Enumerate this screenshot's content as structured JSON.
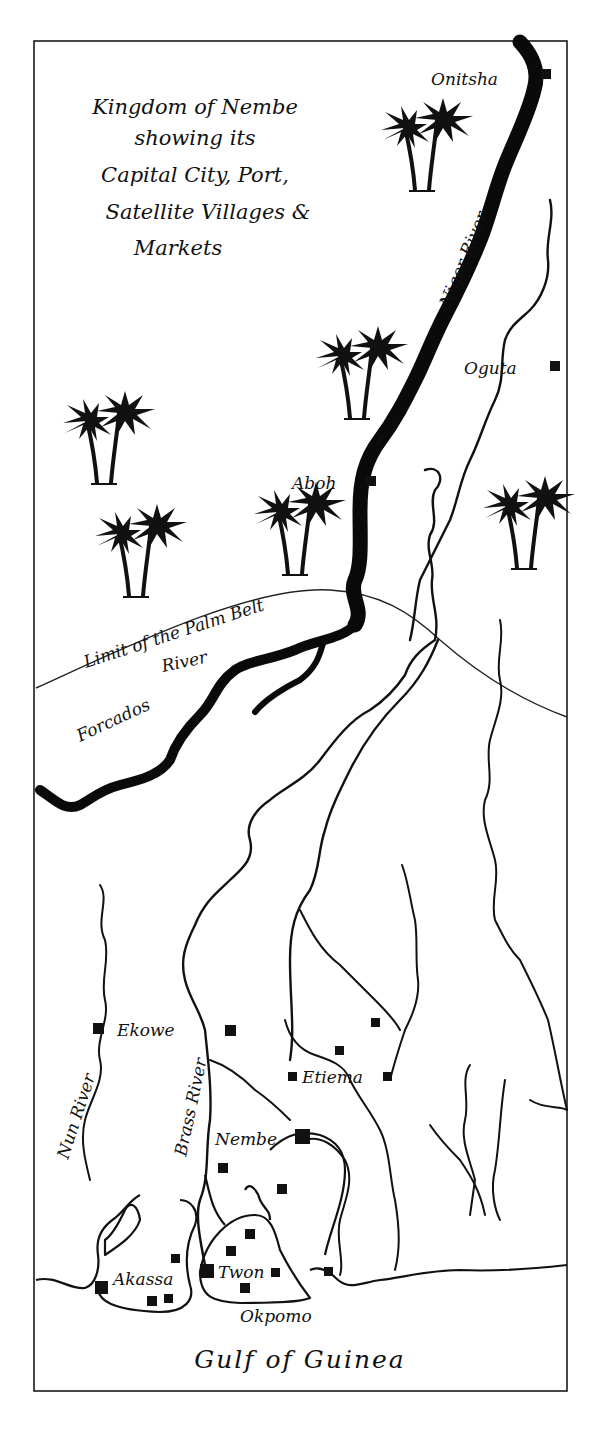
{
  "map": {
    "title_lines": [
      "Kingdom of Nembe",
      "showing its",
      "Capital City, Port,",
      "Satellite Villages &",
      "Markets"
    ],
    "rivers": {
      "niger": "Niger River",
      "forcados_part1": "Forcados",
      "forcados_part2": "River",
      "nun": "Nun River",
      "brass": "Brass River"
    },
    "boundary_label": "Limit of the Palm Belt",
    "sea_label": "Gulf of Guinea",
    "places": {
      "onitsha": "Onitsha",
      "oguta": "Oguta",
      "aboh": "Aboh",
      "ekowe": "Ekowe",
      "etiema": "Etiema",
      "nembe": "Nembe",
      "akassa": "Akassa",
      "twon": "Twon",
      "okpomo": "Okpomo"
    },
    "icons": {
      "palm_tree": "palm-tree-icon",
      "settlement": "settlement-square-marker"
    },
    "colors": {
      "ink": "#111111",
      "paper": "#ffffff"
    }
  }
}
